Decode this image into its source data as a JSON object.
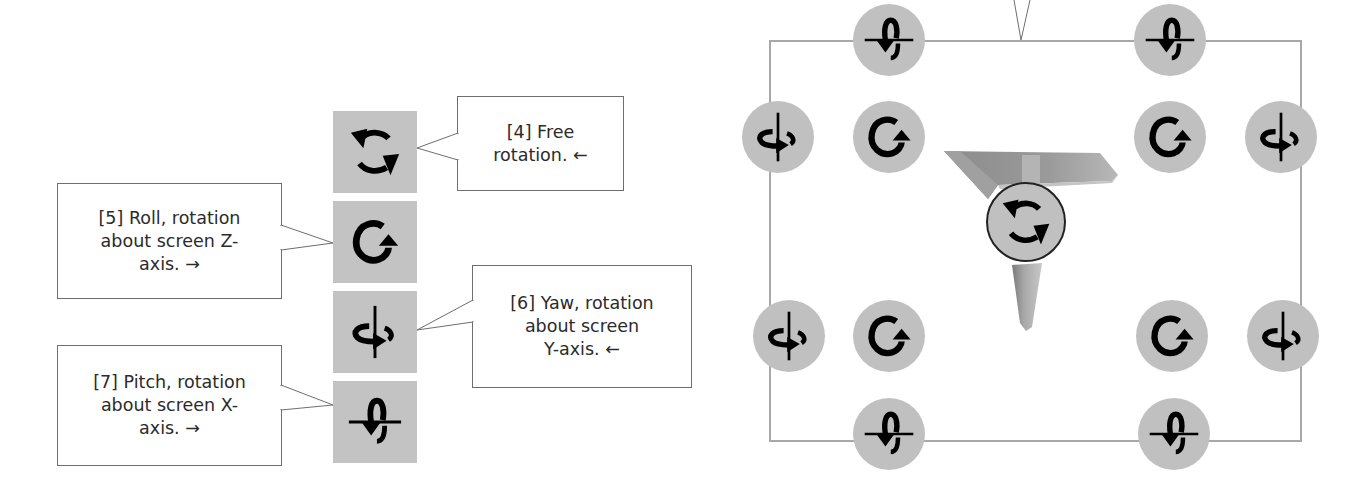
{
  "left_panel": {
    "toolbar": {
      "buttons": [
        {
          "id": 4,
          "icon": "free-rotation-icon",
          "label": "Free rotation"
        },
        {
          "id": 5,
          "icon": "roll-icon",
          "label": "Roll"
        },
        {
          "id": 6,
          "icon": "yaw-icon",
          "label": "Yaw"
        },
        {
          "id": 7,
          "icon": "pitch-icon",
          "label": "Pitch"
        }
      ]
    },
    "callouts": [
      {
        "id": 4,
        "lines": [
          "[4] Free",
          "rotation.  ←"
        ]
      },
      {
        "id": 5,
        "lines": [
          "[5] Roll, rotation",
          "about screen Z-",
          "axis.  →"
        ]
      },
      {
        "id": 6,
        "lines": [
          "[6] Yaw, rotation",
          "about screen",
          "Y-axis.  ←"
        ]
      },
      {
        "id": 7,
        "lines": [
          "[7] Pitch, rotation",
          "about screen X-",
          "axis.  →"
        ]
      }
    ]
  },
  "right_panel": {
    "viewport_handles": {
      "top": [
        "pitch-icon",
        "pitch-icon"
      ],
      "upper_row": [
        "yaw-icon",
        "roll-icon",
        "roll-icon",
        "yaw-icon"
      ],
      "lower_row": [
        "yaw-icon",
        "roll-icon",
        "roll-icon",
        "yaw-icon"
      ],
      "bottom": [
        "pitch-icon",
        "pitch-icon"
      ],
      "center": "free-rotation-icon"
    },
    "model": "t-shaped-part",
    "colors": {
      "handle_fill": "#c0c0c0",
      "frame_stroke": "#a8a8a8",
      "icon_glyph": "#000000"
    }
  }
}
